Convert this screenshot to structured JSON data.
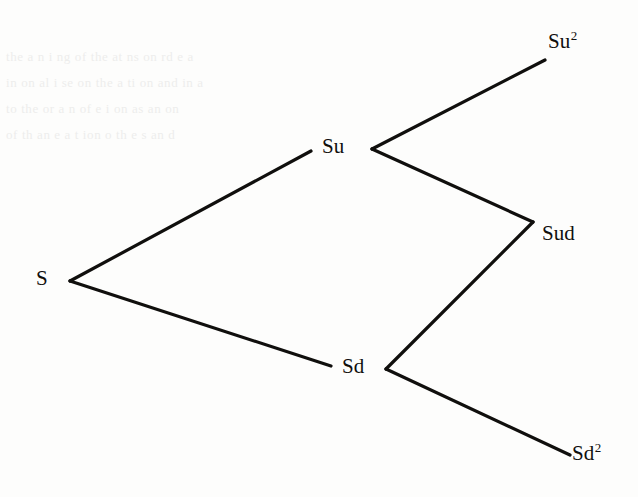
{
  "figure": {
    "kind": "binomial-tree",
    "background_color": "#fdfdfc",
    "line_color": "#100f0d",
    "text_color": "#100f0d",
    "line_width": 3.2,
    "ghost_text": "bleed-through text from reverse side of scanned page"
  },
  "nodes": [
    {
      "id": "s",
      "base": "S",
      "exponent": "",
      "x": 36,
      "y": 268,
      "vertex_x": 70,
      "vertex_y": 281
    },
    {
      "id": "su",
      "base": "Su",
      "exponent": "",
      "x": 322,
      "y": 136,
      "vertex_x": 372,
      "vertex_y": 149
    },
    {
      "id": "sd",
      "base": "Sd",
      "exponent": "",
      "x": 342,
      "y": 356,
      "vertex_x": 386,
      "vertex_y": 369
    },
    {
      "id": "su2",
      "base": "Su",
      "exponent": "2",
      "x": 548,
      "y": 31,
      "vertex_x": 545,
      "vertex_y": 60
    },
    {
      "id": "sud",
      "base": "Sud",
      "exponent": "",
      "x": 542,
      "y": 223,
      "vertex_x": 533,
      "vertex_y": 222
    },
    {
      "id": "sd2",
      "base": "Sd",
      "exponent": "2",
      "x": 572,
      "y": 443,
      "vertex_x": 570,
      "vertex_y": 455
    }
  ],
  "edges": [
    {
      "id": "s-su",
      "from": "s",
      "to": "su",
      "x1": 70,
      "y1": 281,
      "x2": 311,
      "y2": 151,
      "direction": "up"
    },
    {
      "id": "s-sd",
      "from": "s",
      "to": "sd",
      "x1": 70,
      "y1": 281,
      "x2": 331,
      "y2": 366,
      "direction": "down"
    },
    {
      "id": "su-su2",
      "from": "su",
      "to": "su2",
      "x1": 372,
      "y1": 149,
      "x2": 545,
      "y2": 60,
      "direction": "up"
    },
    {
      "id": "su-sud",
      "from": "su",
      "to": "sud",
      "x1": 372,
      "y1": 149,
      "x2": 533,
      "y2": 222,
      "direction": "down"
    },
    {
      "id": "sd-sud",
      "from": "sd",
      "to": "sud",
      "x1": 386,
      "y1": 369,
      "x2": 533,
      "y2": 222,
      "direction": "up"
    },
    {
      "id": "sd-sd2",
      "from": "sd",
      "to": "sd2",
      "x1": 386,
      "y1": 369,
      "x2": 570,
      "y2": 455,
      "direction": "down"
    }
  ],
  "ghost_lines": [
    "the  a   n   i  ng  of  the   at   ns  on  rd  e  a",
    "in  on  al  i   se  on  the  a   ti  on  and  in  a",
    "to  the  or  a  n   of  e   i   on  as  an  on",
    "of  th  an  e  a  t   ion  o   th  e  s  an  d"
  ]
}
